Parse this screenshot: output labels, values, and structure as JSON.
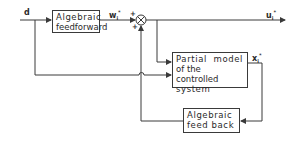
{
  "diagram": {
    "type": "block-diagram",
    "blocks": {
      "feedforward": {
        "line1": "Algebraic",
        "line2": "feedforward"
      },
      "plant_model": {
        "line1": "Partial  model",
        "line2": "of the controlled",
        "line3": "system"
      },
      "feedback": {
        "line1": "Algebraic",
        "line2": "feed back"
      }
    },
    "signals": {
      "d": {
        "base": "d"
      },
      "w": {
        "base": "w",
        "sub": "i",
        "sup": "*"
      },
      "u": {
        "base": "u",
        "sub": "i",
        "sup": "*"
      },
      "x": {
        "base": "x",
        "sub": "i",
        "sup": "*"
      }
    },
    "summing_junction": {
      "signs": {
        "left": "+",
        "bottom": "+",
        "bottom_left": "+"
      }
    },
    "colors": {
      "line": "#3a3a3a",
      "background": "#ffffff"
    }
  }
}
